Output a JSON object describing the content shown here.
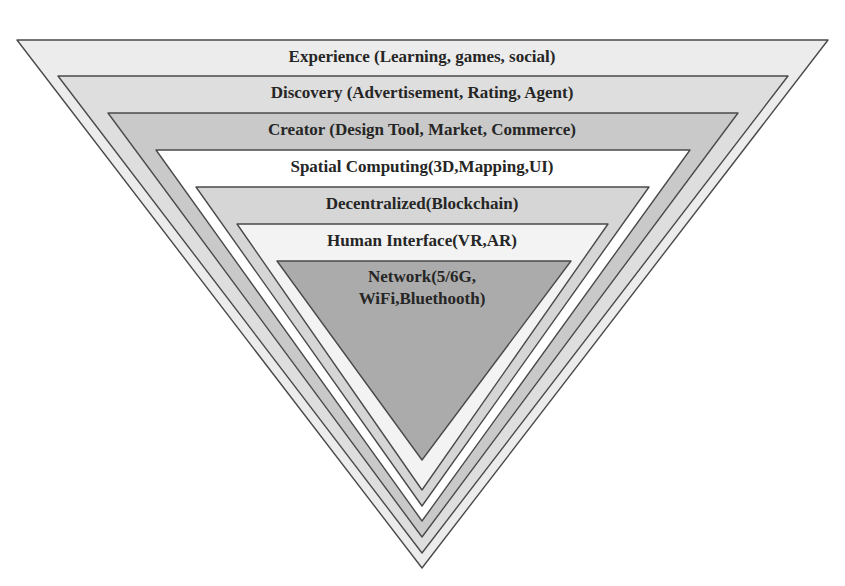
{
  "diagram": {
    "type": "inverted-pyramid",
    "layers": [
      {
        "label_lines": [
          "Experience (Learning, games, social)"
        ],
        "fill": "#ececec",
        "points": "17,40 828,40 422,568",
        "label_y": [
          62
        ]
      },
      {
        "label_lines": [
          "Discovery (Advertisement, Rating, Agent)"
        ],
        "fill": "#dedede",
        "points": "58,76 788,76 422,553",
        "label_y": [
          98
        ]
      },
      {
        "label_lines": [
          "Creator (Design Tool, Market, Commerce)"
        ],
        "fill": "#c9c9c9",
        "points": "108,113 738,113 422,537",
        "label_y": [
          135
        ]
      },
      {
        "label_lines": [
          "Spatial Computing(3D,Mapping,UI)"
        ],
        "fill": "#ffffff",
        "points": "156,150 690,150 422,521",
        "label_y": [
          172
        ]
      },
      {
        "label_lines": [
          "Decentralized(Blockchain)"
        ],
        "fill": "#d6d6d6",
        "points": "196,187 649,187 422,506",
        "label_y": [
          209
        ]
      },
      {
        "label_lines": [
          "Human Interface(VR,AR)"
        ],
        "fill": "#f3f3f3",
        "points": "237,224 608,224 422,490",
        "label_y": [
          246
        ]
      },
      {
        "label_lines": [
          "Network(5/6G,",
          "WiFi,Bluethooth)"
        ],
        "fill": "#ababab",
        "points": "277,261 571,261 422,460",
        "label_y": [
          282,
          304
        ]
      }
    ]
  }
}
